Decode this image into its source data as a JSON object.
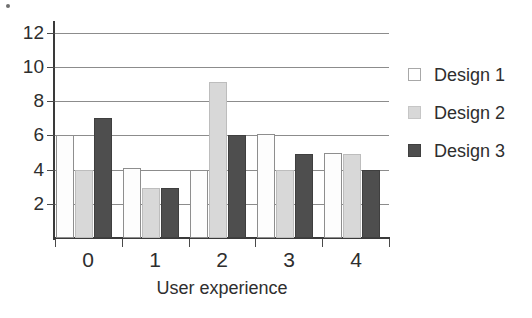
{
  "chart_data": {
    "type": "bar",
    "title": "",
    "xlabel": "User experience",
    "ylabel": "",
    "categories": [
      "0",
      "1",
      "2",
      "3",
      "4"
    ],
    "series": [
      {
        "name": "Design 1",
        "color": "#fdfdfd",
        "values": [
          6,
          4.1,
          4,
          6.1,
          5
        ]
      },
      {
        "name": "Design 2",
        "color": "#d8d8d8",
        "values": [
          4,
          2.9,
          9.1,
          4,
          4.9
        ]
      },
      {
        "name": "Design 3",
        "color": "#4e4e4e",
        "values": [
          7,
          2.9,
          6,
          4.9,
          4
        ]
      }
    ],
    "ylim": [
      0,
      12.4
    ],
    "yticks": [
      2,
      4,
      6,
      8,
      10,
      12
    ],
    "ytick_labels": [
      "2",
      "4",
      "6",
      "8",
      "10",
      "12"
    ],
    "xtick_labels": [
      "0",
      "1",
      "2",
      "3",
      "4"
    ],
    "grid": true,
    "grid_axis": "y",
    "legend_position": "right"
  },
  "legend": {
    "entries": [
      {
        "label": "Design 1"
      },
      {
        "label": "Design 2"
      },
      {
        "label": "Design 3"
      }
    ]
  },
  "axes": {
    "x_title": "User experience"
  }
}
